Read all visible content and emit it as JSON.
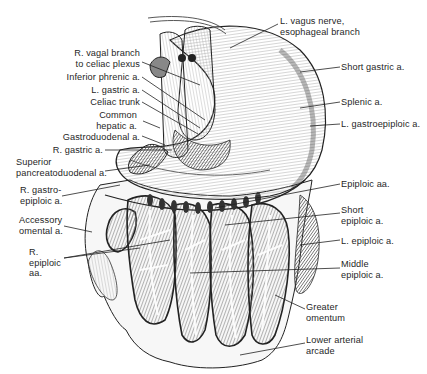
{
  "figure": {
    "labels_left": [
      {
        "id": "r-vagal-branch",
        "text": "R. vagal branch\nto celiac plexus"
      },
      {
        "id": "inferior-phrenic",
        "text": "Inferior phrenic a."
      },
      {
        "id": "l-gastric",
        "text": "L. gastric a."
      },
      {
        "id": "celiac-trunk",
        "text": "Celiac trunk"
      },
      {
        "id": "common-hepatic",
        "text": "Common\nhepatic a."
      },
      {
        "id": "gastroduodenal",
        "text": "Gastroduodenal a."
      },
      {
        "id": "r-gastric",
        "text": "R. gastric a."
      },
      {
        "id": "sup-pancreatoduodenal",
        "text": "Superior\npancreatoduodenal a."
      },
      {
        "id": "r-gastroepiploic",
        "text": "R. gastro-\nepiploic a."
      },
      {
        "id": "accessory-omental",
        "text": "Accessory\nomental a."
      },
      {
        "id": "r-epiploic",
        "text": "R.\nepiploic\naa."
      }
    ],
    "labels_right": [
      {
        "id": "l-vagus",
        "text": "L. vagus nerve,\nesophageal branch"
      },
      {
        "id": "short-gastric",
        "text": "Short gastric a."
      },
      {
        "id": "splenic",
        "text": "Splenic a."
      },
      {
        "id": "l-gastroepiploic",
        "text": "L. gastroepiploic a."
      },
      {
        "id": "epiploic-aa",
        "text": "Epiploic aa."
      },
      {
        "id": "short-epiploic",
        "text": "Short\nepiploic a."
      },
      {
        "id": "l-epiploic",
        "text": "L. epiploic a."
      },
      {
        "id": "middle-epiploic",
        "text": "Middle\nepiploic a."
      },
      {
        "id": "greater-omentum",
        "text": "Greater\nomentum"
      },
      {
        "id": "lower-arterial-arcade",
        "text": "Lower arterial\narcade"
      }
    ]
  },
  "colors": {
    "ink": "#1f1f1f",
    "shade_dark": "#555555",
    "shade_mid": "#8a8a8a",
    "shade_light": "#bdbdbd",
    "paper": "#ffffff"
  }
}
